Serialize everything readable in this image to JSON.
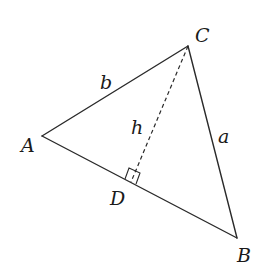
{
  "diagram": {
    "type": "triangle-with-altitude",
    "vertices": {
      "A": {
        "label": "A",
        "x": 42,
        "y": 136
      },
      "B": {
        "label": "B",
        "x": 237,
        "y": 238
      },
      "C": {
        "label": "C",
        "x": 188,
        "y": 46
      },
      "D": {
        "label": "D",
        "x": 131,
        "y": 182
      }
    },
    "sides": {
      "a": {
        "label": "a",
        "from": "C",
        "to": "B"
      },
      "b": {
        "label": "b",
        "from": "A",
        "to": "C"
      },
      "c": {
        "label": "",
        "from": "A",
        "to": "B"
      }
    },
    "altitude": {
      "label": "h",
      "from": "C",
      "to": "D",
      "style": "dashed"
    },
    "right_angle_marker": {
      "at": "D"
    },
    "colors": {
      "stroke": "#2a2a2a",
      "text": "#1a1a1a",
      "background": "#ffffff"
    }
  }
}
